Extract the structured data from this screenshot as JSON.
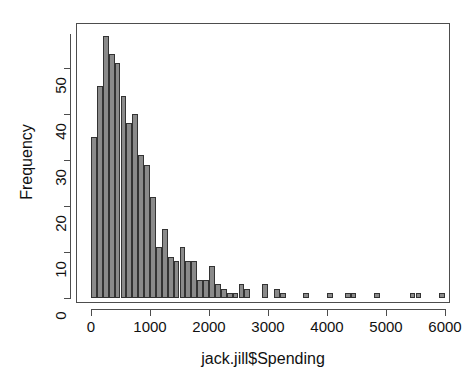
{
  "chart_data": {
    "type": "bar",
    "subtype": "histogram",
    "title": "",
    "xlabel": "jack.jill$Spending",
    "ylabel": "Frequency",
    "xlim": [
      -60,
      6320
    ],
    "ylim": [
      0,
      59
    ],
    "grid": false,
    "legend": null,
    "bin_width": 100,
    "bar_color": "#8a8a8a",
    "bar_border_color": "#333333",
    "axis_color": "#4d4d4d",
    "background_color": "#ffffff",
    "xticks": [
      0,
      1000,
      2000,
      3000,
      4000,
      5000,
      6000
    ],
    "xtick_labels": [
      "0",
      "1000",
      "2000",
      "3000",
      "4000",
      "5000",
      "6000"
    ],
    "yticks": [
      0,
      10,
      20,
      30,
      40,
      50
    ],
    "ytick_labels": [
      "0",
      "10",
      "20",
      "30",
      "40",
      "50"
    ],
    "bin_starts": [
      0,
      100,
      200,
      300,
      400,
      500,
      600,
      700,
      800,
      900,
      1000,
      1100,
      1200,
      1300,
      1400,
      1500,
      1600,
      1700,
      1800,
      1900,
      2000,
      2100,
      2200,
      2300,
      2400,
      2500,
      2600,
      2700,
      2800,
      2900,
      3000,
      3100,
      3200,
      3300,
      3400,
      3500,
      3600,
      3700,
      3800,
      3900,
      4000,
      4100,
      4200,
      4300,
      4400,
      4500,
      4600,
      4700,
      4800,
      4900,
      5000,
      5100,
      5200,
      5300,
      5400,
      5500,
      5600,
      5700,
      5800,
      5900
    ],
    "values": [
      35,
      46,
      57,
      53,
      51,
      44,
      38,
      40,
      31,
      29,
      22,
      11,
      15,
      9,
      8,
      11,
      8,
      8,
      4,
      4,
      7,
      3,
      2,
      1,
      1,
      3,
      2,
      0,
      0,
      3,
      0,
      2,
      1,
      0,
      0,
      0,
      1,
      0,
      0,
      0,
      1,
      0,
      0,
      1,
      1,
      0,
      0,
      0,
      1,
      0,
      0,
      0,
      0,
      0,
      1,
      1,
      0,
      0,
      0,
      1
    ],
    "categories": [
      "0-100",
      "100-200",
      "200-300",
      "300-400",
      "400-500",
      "500-600",
      "600-700",
      "700-800",
      "800-900",
      "900-1000",
      "1000-1100",
      "1100-1200",
      "1200-1300",
      "1300-1400",
      "1400-1500",
      "1500-1600",
      "1600-1700",
      "1700-1800",
      "1800-1900",
      "1900-2000",
      "2000-2100",
      "2100-2200",
      "2200-2300",
      "2300-2400",
      "2400-2500",
      "2500-2600",
      "2600-2700",
      "2700-2800",
      "2800-2900",
      "2900-3000",
      "3000-3100",
      "3100-3200",
      "3200-3300",
      "3300-3400",
      "3400-3500",
      "3500-3600",
      "3600-3700",
      "3700-3800",
      "3800-3900",
      "3900-4000",
      "4000-4100",
      "4100-4200",
      "4200-4300",
      "4300-4400",
      "4400-4500",
      "4500-4600",
      "4600-4700",
      "4700-4800",
      "4800-4900",
      "4900-5000",
      "5000-5100",
      "5100-5200",
      "5200-5300",
      "5300-5400",
      "5400-5500",
      "5500-5600",
      "5600-5700",
      "5700-5800",
      "5800-5900",
      "5900-6000"
    ]
  }
}
